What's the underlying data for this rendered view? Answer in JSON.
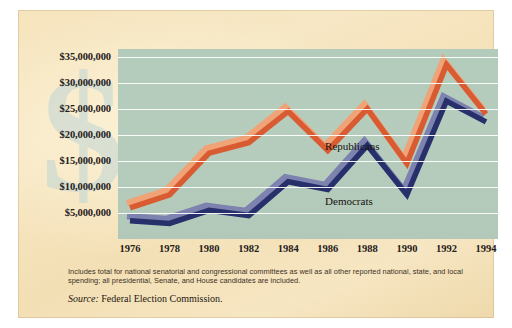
{
  "chart_data": {
    "type": "line",
    "title": "",
    "xlabel": "",
    "ylabel": "",
    "categories": [
      1976,
      1978,
      1980,
      1982,
      1984,
      1986,
      1988,
      1990,
      1992,
      1994
    ],
    "x_tick_labels": [
      "1976",
      "1978",
      "1980",
      "1982",
      "1984",
      "1986",
      "1988",
      "1990",
      "1992",
      "1994"
    ],
    "y_tick_labels": [
      "$35,000,000",
      "$30,000,000",
      "$25,000,000",
      "$20,000,000",
      "$15,000,000",
      "$10,000,000",
      "$5,000,000"
    ],
    "y_tick_values": [
      35000000,
      30000000,
      25000000,
      20000000,
      15000000,
      10000000,
      5000000
    ],
    "ylim": [
      0,
      36500000
    ],
    "grid": true,
    "legend_position": "inline-annotations",
    "series": [
      {
        "name": "Republicans",
        "color": "#d95b32",
        "highlight_color": "#efa377",
        "values": [
          6000000,
          8500000,
          16500000,
          18500000,
          24500000,
          17000000,
          25000000,
          14500000,
          33500000,
          24000000
        ]
      },
      {
        "name": "Democrats",
        "color": "#27306b",
        "highlight_color": "#7d83ae",
        "values": [
          3500000,
          3000000,
          5500000,
          4500000,
          11000000,
          9500000,
          18000000,
          8500000,
          26500000,
          22500000
        ]
      }
    ],
    "annotations": [
      {
        "text": "Republicans",
        "x_fraction": 0.545,
        "y_pixel": 130
      },
      {
        "text": "Democrats",
        "x_fraction": 0.545,
        "y_pixel": 185
      }
    ]
  },
  "footnote": {
    "line1": "Includes total for national senatorial and congressional committees as well as all other reported national,",
    "line2": "state, and local spending; all presidential, Senate, and House candidates are included."
  },
  "source": {
    "label": "Source:",
    "text": " Federal Election Commission."
  },
  "watermark": {
    "glyph": "$"
  },
  "colors": {
    "page_background": "#f4e2ba",
    "plot_background": "#b4cbbc",
    "gridline": "#ffffff",
    "republican_line": "#d95b32",
    "republican_shadow": "#efa377",
    "democrat_line": "#27306b",
    "democrat_shadow": "#7d83ae",
    "text": "#25201a"
  }
}
